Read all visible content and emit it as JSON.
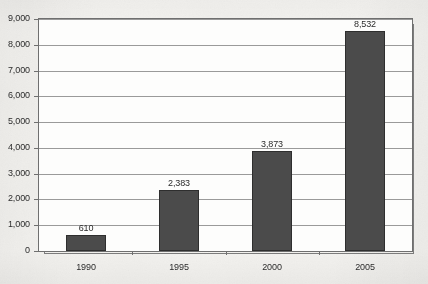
{
  "chart_data": {
    "type": "bar",
    "title": "",
    "subtitle": "",
    "xlabel": "",
    "ylabel": "",
    "categories": [
      "1990",
      "1995",
      "2000",
      "2005"
    ],
    "values": [
      610,
      2383,
      3873,
      8532
    ],
    "value_labels": [
      "610",
      "2,383",
      "3,873",
      "8,532"
    ],
    "series": [
      {
        "name": "",
        "values": [
          610,
          2383,
          3873,
          8532
        ]
      }
    ],
    "ylim": [
      0,
      9000
    ],
    "ytick_values": [
      0,
      1000,
      2000,
      3000,
      4000,
      5000,
      6000,
      7000,
      8000,
      9000
    ],
    "ytick_labels": [
      "0",
      "1,000",
      "2,000",
      "3,000",
      "4,000",
      "5,000",
      "6,000",
      "7,000",
      "8,000",
      "9,000"
    ],
    "grid": true,
    "grid_axis": "y",
    "legend": false,
    "legend_position": "none",
    "bar_color": "#4b4b4b",
    "bar_edge_color": "#2e2e2e",
    "grid_color": "#9a9a9a",
    "axis_color": "#6f6f6f",
    "plot_background": "#fdfdfc",
    "page_background": "#f4f3f0",
    "data_labels_shown": true,
    "data_label_position": "above-bar"
  }
}
